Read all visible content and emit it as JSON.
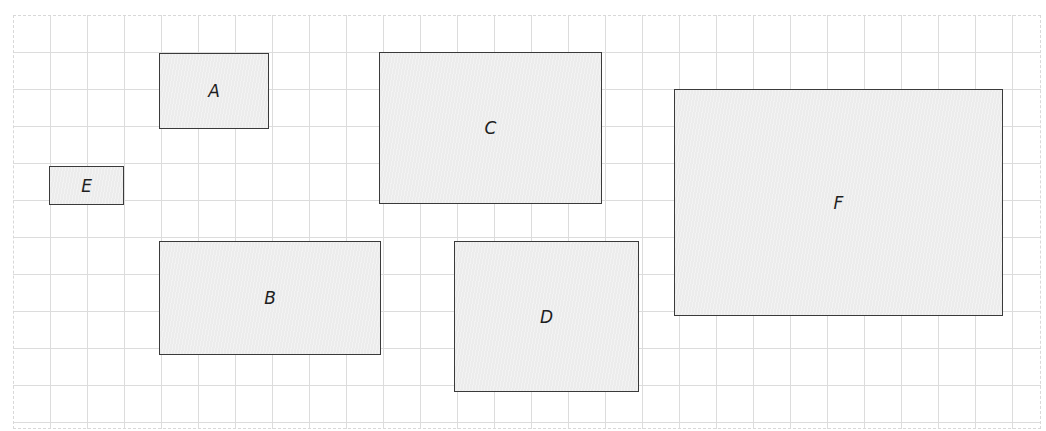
{
  "diagram": {
    "grid": {
      "x": 13,
      "y": 15,
      "width": 1028,
      "height": 414,
      "spacing": 37,
      "line_color": "#dcdcdc"
    },
    "style": {
      "fill": "#ececec",
      "stroke": "#3a3a3a"
    },
    "rectangles": [
      {
        "label": "A",
        "x": 159,
        "y": 53,
        "w": 110,
        "h": 76
      },
      {
        "label": "B",
        "x": 159,
        "y": 241,
        "w": 222,
        "h": 114
      },
      {
        "label": "C",
        "x": 379,
        "y": 52,
        "w": 223,
        "h": 152
      },
      {
        "label": "D",
        "x": 454,
        "y": 241,
        "w": 185,
        "h": 151
      },
      {
        "label": "E",
        "x": 49,
        "y": 166,
        "w": 75,
        "h": 39
      },
      {
        "label": "F",
        "x": 674,
        "y": 89,
        "w": 329,
        "h": 227
      }
    ]
  }
}
